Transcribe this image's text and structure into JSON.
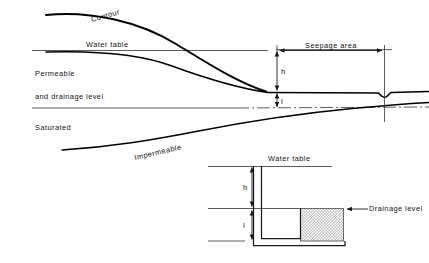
{
  "figure": {
    "domain_kind": "engineering-cross-section-diagram",
    "background_color": "#ffffff",
    "ink_color": "#000000",
    "reference_line_color": "#4a4a4a"
  },
  "main_diagram": {
    "labels": {
      "contour": "Contour",
      "water_table": "Water table",
      "permeable": "Permeable",
      "and_drainage_level": "and  drainage  level",
      "saturated": "Saturated",
      "impermeable": "Impermeable",
      "seepage_area": "Seepage  area",
      "dim_h": "h",
      "dim_l": "l"
    },
    "label_rotations_deg": {
      "contour": -16,
      "impermeable": -13
    }
  },
  "inset_diagram": {
    "labels": {
      "water_table": "Water  table",
      "drainage_level": "Drainage  level",
      "dim_h": "h",
      "dim_l": "l"
    },
    "fill": {
      "drainage_block_pattern": "stipple-checker",
      "drainage_block_color": "#d9d9d9"
    }
  }
}
